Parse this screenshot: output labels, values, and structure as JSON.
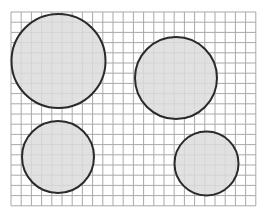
{
  "diagram": {
    "type": "circles-on-grid",
    "background": "#ffffff",
    "grid": {
      "x0": 11,
      "y0": 12,
      "cols": 24,
      "rows": 19,
      "cell": 10.2,
      "line_color": "#a8a8a8"
    },
    "circle_style": {
      "fill": "#dcdcdc",
      "fill_opacity": 0.85,
      "stroke": "#2a2a2a",
      "stroke_width": 2
    },
    "circles": [
      {
        "name": "large-circle-top-left",
        "cx": 58.5,
        "cy": 61,
        "r": 47
      },
      {
        "name": "circle-top-right",
        "cx": 176,
        "cy": 78,
        "r": 41
      },
      {
        "name": "circle-bottom-left",
        "cx": 58,
        "cy": 157,
        "r": 36
      },
      {
        "name": "small-circle-bottom-right",
        "cx": 206.5,
        "cy": 163.5,
        "r": 32
      }
    ]
  }
}
